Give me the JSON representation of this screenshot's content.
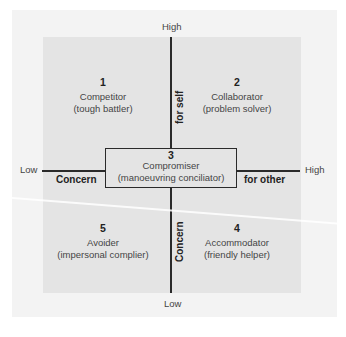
{
  "diagram": {
    "type": "conflict-handling-styles-grid",
    "vertical_axis": {
      "label_top": "High",
      "label_bottom": "Low",
      "label_upper": "for self",
      "label_lower": "Concern"
    },
    "horizontal_axis": {
      "label_left": "Low",
      "label_right": "High",
      "label_left_inner": "Concern",
      "label_right_inner": "for other"
    },
    "styles": [
      {
        "number": "1",
        "name": "Competitor",
        "desc": "(tough battler)",
        "position": "top-left"
      },
      {
        "number": "2",
        "name": "Collaborator",
        "desc": "(problem solver)",
        "position": "top-right"
      },
      {
        "number": "3",
        "name": "Compromiser",
        "desc": "(manoeuvring conciliator)",
        "position": "center"
      },
      {
        "number": "4",
        "name": "Accommodator",
        "desc": "(friendly helper)",
        "position": "bottom-right"
      },
      {
        "number": "5",
        "name": "Avoider",
        "desc": "(impersonal complier)",
        "position": "bottom-left"
      }
    ]
  },
  "colors": {
    "page_bg": "#ffffff",
    "frame_bg": "#f3f3f3",
    "grid_bg": "#e4e4e4",
    "lines": "#2a2a2a"
  }
}
